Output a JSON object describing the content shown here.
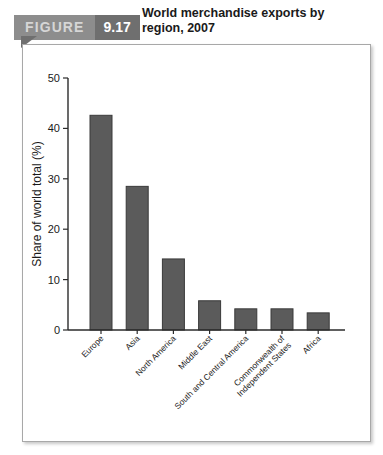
{
  "figure": {
    "label": "FIGURE",
    "number": "9.17",
    "title": "World merchandise exports by region, 2007"
  },
  "colors": {
    "bar_fill": "#5b5b5b",
    "bar_stroke": "#3a3a3a",
    "banner_label_bg": "#8d8d8d",
    "banner_number_bg": "#6f6f6f",
    "frame_border": "#a8a8a8",
    "axis": "#2b2b2b"
  },
  "chart_data": {
    "type": "bar",
    "title": "World merchandise exports by region, 2007",
    "xlabel": "",
    "ylabel": "Share of world total (%)",
    "ylim": [
      0,
      50
    ],
    "yticks": [
      0,
      10,
      20,
      30,
      40,
      50
    ],
    "ytick_labels": [
      "0",
      "10",
      "20",
      "30",
      "40",
      "50"
    ],
    "grid": false,
    "legend": false,
    "categories": [
      "Europe",
      "Asia",
      "North America",
      "Middle East",
      "South and Central America",
      "Commonwealth of Independent States",
      "Africa"
    ],
    "category_lines": [
      [
        "Europe"
      ],
      [
        "Asia"
      ],
      [
        "North America"
      ],
      [
        "Middle East"
      ],
      [
        "South and Central America"
      ],
      [
        "Commonwealth of",
        "Independent States"
      ],
      [
        "Africa"
      ]
    ],
    "values": [
      42.6,
      28.5,
      14.1,
      5.8,
      4.2,
      4.2,
      3.4
    ]
  }
}
